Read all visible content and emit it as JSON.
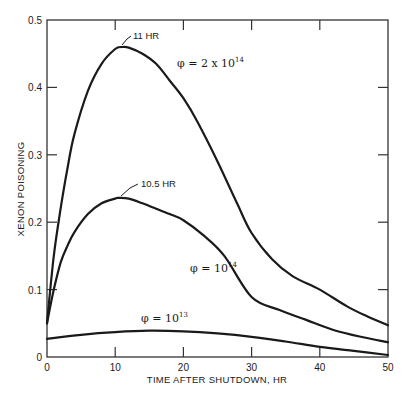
{
  "chart_data": {
    "type": "line",
    "title": "",
    "xlabel": "TIME AFTER SHUTDOWN, HR",
    "ylabel": "XENON POISONING",
    "xlim": [
      0,
      50
    ],
    "ylim": [
      0,
      0.5
    ],
    "x_ticks": [
      "0",
      "10",
      "20",
      "30",
      "40",
      "50"
    ],
    "y_ticks": [
      "0",
      "0.1",
      "0.2",
      "0.3",
      "0.4",
      "0.5"
    ],
    "grid": false,
    "legend": "inline labels",
    "series": [
      {
        "name": "φ = 2 × 10^14",
        "label_main": "φ = 2 x 10",
        "label_exp": "14",
        "peak_annotation": "11 HR",
        "x": [
          0,
          1,
          2,
          3,
          4,
          6,
          8,
          10,
          11,
          12,
          14,
          16,
          18,
          20,
          22,
          25,
          28,
          30,
          33,
          36,
          40,
          44,
          47,
          50
        ],
        "values": [
          0.05,
          0.15,
          0.22,
          0.28,
          0.33,
          0.395,
          0.435,
          0.457,
          0.46,
          0.459,
          0.45,
          0.435,
          0.41,
          0.384,
          0.35,
          0.29,
          0.225,
          0.184,
          0.145,
          0.12,
          0.1,
          0.075,
          0.06,
          0.047
        ]
      },
      {
        "name": "φ = 10^14",
        "label_main": "φ = 10",
        "label_exp": "14",
        "peak_annotation": "10.5 HR",
        "x": [
          0,
          1,
          2,
          3,
          4,
          6,
          8,
          10,
          10.5,
          12,
          14,
          16,
          18,
          20,
          23,
          26,
          30,
          34,
          38,
          42,
          46,
          50
        ],
        "values": [
          0.05,
          0.1,
          0.14,
          0.165,
          0.185,
          0.212,
          0.228,
          0.235,
          0.236,
          0.235,
          0.228,
          0.22,
          0.212,
          0.203,
          0.18,
          0.15,
          0.089,
          0.07,
          0.055,
          0.04,
          0.03,
          0.022
        ]
      },
      {
        "name": "φ = 10^13",
        "label_main": "φ = 10",
        "label_exp": "13",
        "x": [
          0,
          5,
          10,
          15,
          20,
          25,
          30,
          35,
          40,
          45,
          50
        ],
        "values": [
          0.027,
          0.033,
          0.037,
          0.039,
          0.038,
          0.035,
          0.03,
          0.023,
          0.015,
          0.009,
          0.003
        ]
      }
    ]
  }
}
